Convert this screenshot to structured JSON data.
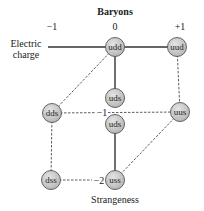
{
  "title": "Baryons",
  "axis_labels": {
    "charge_label_line1": "Electric",
    "charge_label_line2": "charge",
    "strangeness_label": "Strangeness"
  },
  "charge_ticks": [
    "−1",
    "0",
    "+1"
  ],
  "strangeness_ticks": [
    "−1",
    "−2"
  ],
  "colors": {
    "node_fill": "#c8c8c8",
    "node_stroke": "#555555",
    "line": "#333333"
  },
  "nodes": [
    {
      "id": "udd",
      "label": "udd"
    },
    {
      "id": "uud",
      "label": "uud"
    },
    {
      "id": "uds_top",
      "label": "uds"
    },
    {
      "id": "uds_bottom",
      "label": "uds"
    },
    {
      "id": "dds",
      "label": "dds"
    },
    {
      "id": "uus",
      "label": "uus"
    },
    {
      "id": "dss",
      "label": "dss"
    },
    {
      "id": "uss",
      "label": "uss"
    }
  ],
  "edges": [
    {
      "from": "charge_axis_start",
      "to": "udd",
      "style": "solid"
    },
    {
      "from": "udd",
      "to": "uud",
      "style": "solid"
    },
    {
      "from": "udd",
      "to": "uds_top",
      "style": "solid"
    },
    {
      "from": "uds_bottom",
      "to": "uss",
      "style": "solid"
    },
    {
      "from": "udd",
      "to": "dds",
      "style": "dashed"
    },
    {
      "from": "uud",
      "to": "uus",
      "style": "dashed"
    },
    {
      "from": "dds",
      "to": "uus",
      "style": "dashed"
    },
    {
      "from": "dds",
      "to": "dss",
      "style": "dashed"
    },
    {
      "from": "dss",
      "to": "uss",
      "style": "dashed"
    },
    {
      "from": "uus",
      "to": "uss",
      "style": "dashed"
    }
  ]
}
